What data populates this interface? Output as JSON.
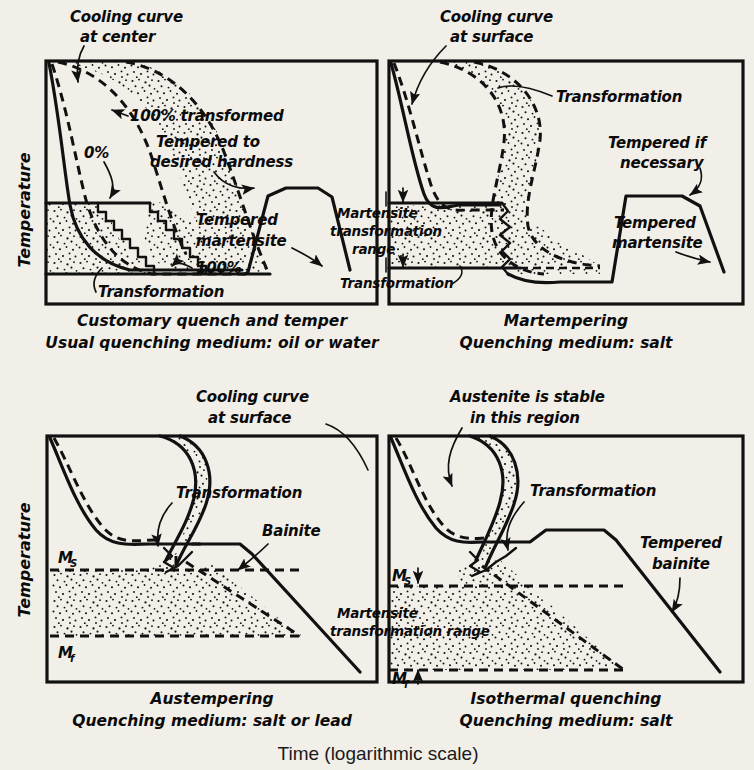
{
  "figure": {
    "axis_label_y": "Temperature",
    "axis_label_x": "Time (logarithmic scale)"
  },
  "panels": [
    {
      "id": "customary-quench-and-temper",
      "caption_line1": "Customary quench and temper",
      "caption_line2": "Usual quenching medium: oil or water",
      "annotations": [
        {
          "name": "cooling-curve-at-center-l1",
          "text": "Cooling curve"
        },
        {
          "name": "cooling-curve-at-center-l2",
          "text": "at center"
        },
        {
          "name": "pct-100-transformed",
          "text": "100% transformed"
        },
        {
          "name": "tempered-to-desired-hardness-l1",
          "text": "Tempered to"
        },
        {
          "name": "tempered-to-desired-hardness-l2",
          "text": "desired hardness"
        },
        {
          "name": "pct-0",
          "text": "0%"
        },
        {
          "name": "pct-100",
          "text": "100%"
        },
        {
          "name": "tempered-martensite-l1",
          "text": "Tempered"
        },
        {
          "name": "tempered-martensite-l2",
          "text": "martensite"
        },
        {
          "name": "transformation",
          "text": "Transformation"
        }
      ]
    },
    {
      "id": "martempering",
      "caption_line1": "Martempering",
      "caption_line2": "Quenching medium: salt",
      "annotations": [
        {
          "name": "cooling-curve-at-surface-l1",
          "text": "Cooling curve"
        },
        {
          "name": "cooling-curve-at-surface-l2",
          "text": "at surface"
        },
        {
          "name": "transformation-top",
          "text": "Transformation"
        },
        {
          "name": "tempered-if-necessary-l1",
          "text": "Tempered if"
        },
        {
          "name": "tempered-if-necessary-l2",
          "text": "necessary"
        },
        {
          "name": "tempered-martensite-l1",
          "text": "Tempered"
        },
        {
          "name": "tempered-martensite-l2",
          "text": "martensite"
        },
        {
          "name": "martensite-transformation-range-l1",
          "text": "Martensite"
        },
        {
          "name": "martensite-transformation-range-l2",
          "text": "transformation"
        },
        {
          "name": "martensite-transformation-range-l3",
          "text": "range"
        },
        {
          "name": "transformation-bottom",
          "text": "Transformation"
        }
      ]
    },
    {
      "id": "austempering",
      "caption_line1": "Austempering",
      "caption_line2": "Quenching medium: salt or lead",
      "annotations": [
        {
          "name": "cooling-curve-at-surface-l1",
          "text": "Cooling curve"
        },
        {
          "name": "cooling-curve-at-surface-l2",
          "text": "at surface"
        },
        {
          "name": "transformation",
          "text": "Transformation"
        },
        {
          "name": "bainite",
          "text": "Bainite"
        },
        {
          "name": "ms-marker",
          "text": "M"
        },
        {
          "name": "ms-subscript",
          "text": "S"
        },
        {
          "name": "mf-marker",
          "text": "M"
        },
        {
          "name": "mf-subscript",
          "text": "f"
        }
      ]
    },
    {
      "id": "isothermal-quenching",
      "caption_line1": "Isothermal quenching",
      "caption_line2": "Quenching medium: salt",
      "annotations": [
        {
          "name": "austenite-is-stable-l1",
          "text": "Austenite is stable"
        },
        {
          "name": "austenite-is-stable-l2",
          "text": "in this region"
        },
        {
          "name": "transformation",
          "text": "Transformation"
        },
        {
          "name": "tempered-bainite-l1",
          "text": "Tempered"
        },
        {
          "name": "tempered-bainite-l2",
          "text": "bainite"
        },
        {
          "name": "martensite-transformation-range-l1",
          "text": "Martensite"
        },
        {
          "name": "martensite-transformation-range-l2",
          "text": "transformation range"
        },
        {
          "name": "ms-marker",
          "text": "M"
        },
        {
          "name": "ms-subscript",
          "text": "S"
        },
        {
          "name": "mf-marker",
          "text": "M"
        },
        {
          "name": "mf-subscript",
          "text": "f"
        }
      ]
    }
  ],
  "colors": {
    "background": "#f2efe9",
    "ink": "#111111"
  }
}
